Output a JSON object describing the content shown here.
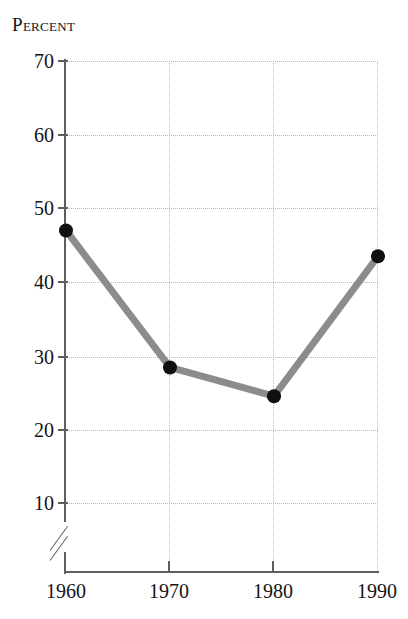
{
  "chart_data": {
    "type": "line",
    "title": "Percent",
    "xlabel": "",
    "ylabel": "",
    "categories": [
      "1960",
      "1970",
      "1980",
      "1990"
    ],
    "x": [
      1960,
      1970,
      1980,
      1990
    ],
    "values": [
      47,
      28.4,
      24.5,
      43.5
    ],
    "series": [
      {
        "name": "Percent",
        "values": [
          47,
          28.4,
          24.5,
          43.5
        ]
      }
    ],
    "ylim": [
      0,
      70
    ],
    "yticks": [
      70,
      60,
      50,
      40,
      30,
      20,
      10
    ],
    "ytick_labels": [
      "70",
      "60",
      "50",
      "40",
      "30",
      "20",
      "10"
    ],
    "xticks": [
      1960,
      1970,
      1980,
      1990
    ],
    "xtick_labels": [
      "1960",
      "1970",
      "1980",
      "1990"
    ],
    "grid": true,
    "grid_style": "dotted",
    "legend": false,
    "axis_break": {
      "axis": "y",
      "present": true,
      "symbol": "double-slash",
      "below_value": 10
    },
    "colors": {
      "line": "#8c8c8c",
      "marker": "#101010",
      "grid": "#b9b9b9",
      "axis": "#5e5e5e",
      "text": "#141414",
      "background": "#ffffff"
    },
    "marker": "circle",
    "line_width_px": 7,
    "marker_size_px": 14
  }
}
